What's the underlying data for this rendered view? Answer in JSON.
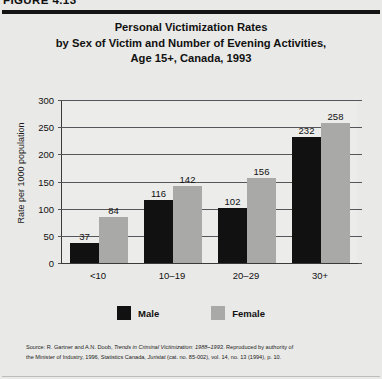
{
  "figure": {
    "number_label": "FIGURE 4.13"
  },
  "chart_data": {
    "type": "bar",
    "title": "Personal Victimization Rates by Sex of Victim and Number of Evening Activities, Age 15+, Canada, 1993",
    "title_lines": [
      "Personal Victimization Rates",
      "by Sex of Victim and Number of Evening Activities,",
      "Age 15+, Canada, 1993"
    ],
    "xlabel": "",
    "ylabel": "Rate per 1000 population",
    "categories": [
      "<10",
      "10–19",
      "20–29",
      "30+"
    ],
    "series": [
      {
        "name": "Male",
        "color": "#111112",
        "values": [
          37,
          116,
          102,
          232
        ]
      },
      {
        "name": "Female",
        "color": "#a9a9a7",
        "values": [
          84,
          142,
          156,
          258
        ]
      }
    ],
    "ylim": [
      0,
      300
    ],
    "yticks": [
      0,
      50,
      100,
      150,
      200,
      250,
      300
    ],
    "ytick_labels": [
      "0",
      "50",
      "100",
      "150",
      "200",
      "250",
      "300"
    ],
    "grid": true,
    "legend_position": "bottom",
    "data_labels": true
  },
  "legend": {
    "items": [
      {
        "label": "Male",
        "swatch": "black-swatch"
      },
      {
        "label": "Female",
        "swatch": "gray-swatch"
      }
    ]
  },
  "source": {
    "line1_prefix": "Source: R. Gartner and A.N. Doob, ",
    "line1_italic": "Trends in Criminal Victimization: 1988–1993",
    "line1_suffix": ". Reproduced by authority of",
    "line2_prefix": "the Minister of Industry, 1996, Statistics Canada, ",
    "line2_italic": "Juristat",
    "line2_suffix": " (cat. no. 85-002), vol. 14, no. 13 (1994), p. 10."
  }
}
